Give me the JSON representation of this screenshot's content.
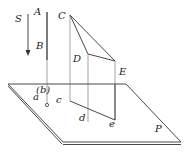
{
  "diagram": {
    "labels": {
      "S": "S",
      "A": "A",
      "B": "B",
      "b": "(b)",
      "a": "a",
      "c": "c",
      "C": "C",
      "D": "D",
      "E": "E",
      "d": "d",
      "e": "e",
      "P": "P"
    },
    "colors": {
      "line": "#333333",
      "background": "#ffffff"
    }
  }
}
